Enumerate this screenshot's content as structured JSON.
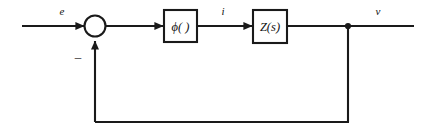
{
  "diagram": {
    "type": "control-system-block-diagram",
    "background_color": "#ffffff",
    "stroke_color": "#1a1a1a"
  },
  "signals": {
    "input_label": "e",
    "intermediate_label": "i",
    "output_label": "v",
    "feedback_sign": "–"
  },
  "blocks": [
    {
      "id": "phi",
      "label": "ϕ( )"
    },
    {
      "id": "z",
      "label": "Z(s)"
    }
  ],
  "nodes": {
    "summing_junction": "summing-junction",
    "takeoff_point": "output-takeoff-node"
  }
}
